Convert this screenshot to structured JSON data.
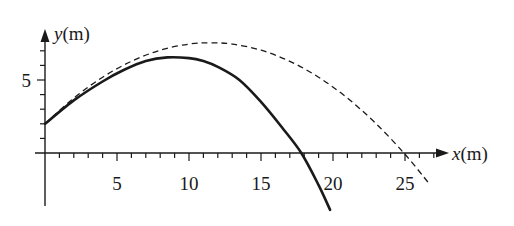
{
  "chart_data": {
    "type": "line",
    "title": "",
    "xlabel": "x(m)",
    "ylabel": "y(m)",
    "xlabel_var": "x",
    "xlabel_unit": "(m)",
    "ylabel_var": "y",
    "ylabel_unit": "(m)",
    "xlim": [
      0,
      27
    ],
    "ylim": [
      -4,
      8
    ],
    "grid": false,
    "legend": null,
    "x_ticks": [
      {
        "value": 5,
        "label": "5"
      },
      {
        "value": 10,
        "label": "10"
      },
      {
        "value": 15,
        "label": "15"
      },
      {
        "value": 20,
        "label": "20"
      },
      {
        "value": 25,
        "label": "25"
      }
    ],
    "x_minor_tick_step": 1,
    "y_ticks": [
      {
        "value": 5,
        "label": "5"
      }
    ],
    "y_minor_tick_step": 1,
    "series": [
      {
        "name": "with air resistance",
        "style": "solid",
        "color": "#1a1a1a",
        "x": [
          0,
          2,
          4,
          5.5,
          7,
          8.5,
          10,
          11,
          12,
          13.5,
          15,
          16.5,
          17.8,
          19,
          19.8
        ],
        "y": [
          2.0,
          3.6,
          4.9,
          5.7,
          6.3,
          6.55,
          6.5,
          6.3,
          5.9,
          5.0,
          3.5,
          1.7,
          0.0,
          -2.2,
          -3.9
        ]
      },
      {
        "name": "without air resistance",
        "style": "dashed",
        "color": "#1a1a1a",
        "x": [
          0,
          2,
          4,
          6,
          8,
          10,
          11.5,
          13,
          15,
          17,
          19,
          21,
          23,
          25,
          26.6
        ],
        "y": [
          2.0,
          3.76,
          5.19,
          6.28,
          7.04,
          7.46,
          7.55,
          7.46,
          7.04,
          6.28,
          5.19,
          3.76,
          2.0,
          -0.09,
          -2.0
        ]
      }
    ]
  }
}
